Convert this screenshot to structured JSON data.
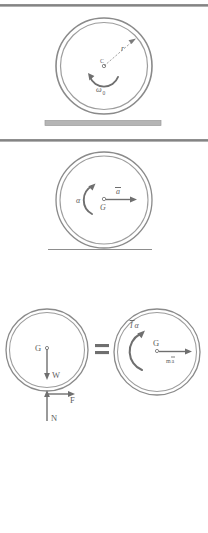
{
  "figure": {
    "background_color": "#ffffff",
    "stroke_color": "#7a7a7a",
    "label_color": "#5e5e5e",
    "ground_bar_color": "#b0b0b0",
    "separator_color": "#8c8c8c"
  },
  "panels": [
    {
      "id": "panel-initial-spin",
      "name": "wheel-with-initial-angular-velocity",
      "wheel": {
        "center_label": "C",
        "radius_label": "r",
        "angular_velocity_label": "ω",
        "angular_velocity_subscript": "0",
        "spin_direction": "counterclockwise"
      },
      "ground": {
        "type": "thick-bar",
        "label": ""
      }
    },
    {
      "id": "panel-acceleration",
      "name": "wheel-with-acceleration",
      "wheel": {
        "center_label": "G",
        "angular_acceleration_label": "α",
        "linear_acceleration_label": "a",
        "linear_acceleration_overbar": true,
        "spin_direction": "counterclockwise",
        "acceleration_direction": "right"
      },
      "ground": {
        "type": "thin-line",
        "label": ""
      }
    },
    {
      "id": "panel-free-body-equals-kinetic",
      "name": "free-body-and-kinetic-diagram",
      "equals_sign": "=",
      "free_body": {
        "center_label": "G",
        "forces": [
          {
            "name": "weight",
            "label": "W",
            "direction": "down"
          },
          {
            "name": "friction",
            "label": "F",
            "direction": "right"
          },
          {
            "name": "normal",
            "label": "N",
            "direction": "up"
          }
        ]
      },
      "kinetic": {
        "center_label": "G",
        "moment_label": "I",
        "moment_overbar": true,
        "moment_suffix": "α",
        "momentum_label": "m",
        "momentum_suffix": "a",
        "momentum_overbar": true,
        "moment_direction": "counterclockwise",
        "momentum_direction": "right"
      }
    }
  ]
}
